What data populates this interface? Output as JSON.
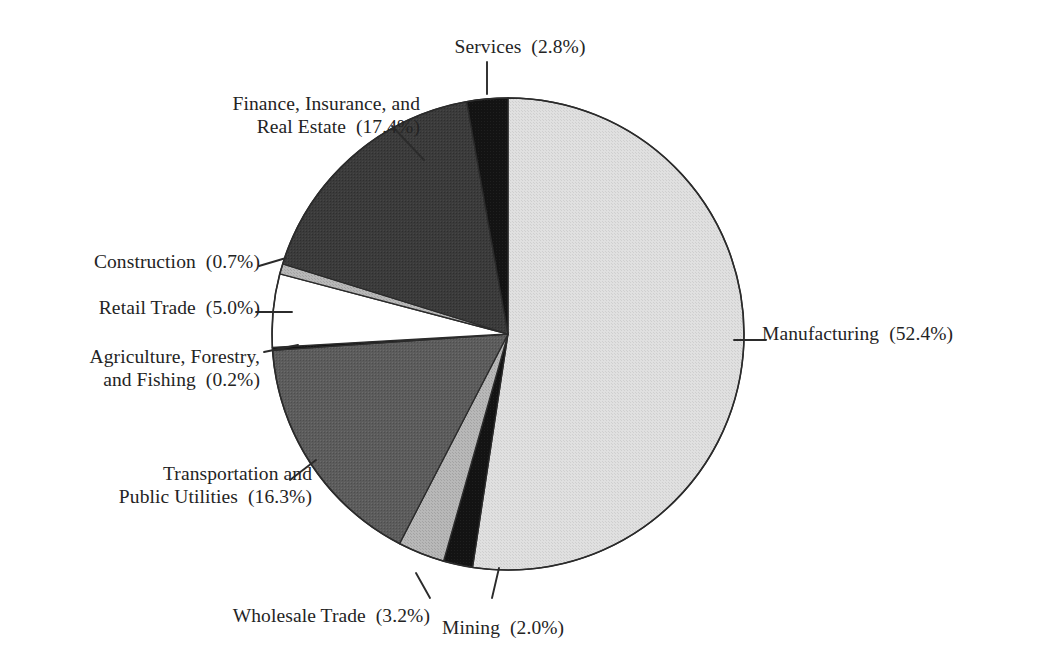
{
  "chart_data": {
    "type": "pie",
    "title": "",
    "subtitle": "",
    "xlabel": "",
    "ylabel": "",
    "legend_position": "none",
    "grid": false,
    "value_unit": "percent",
    "start_angle_deg": 0,
    "direction": "clockwise",
    "categories": [
      "Manufacturing",
      "Mining",
      "Wholesale Trade",
      "Transportation and Public Utilities",
      "Agriculture, Forestry, and Fishing",
      "Retail Trade",
      "Construction",
      "Finance, Insurance, and Real Estate",
      "Services"
    ],
    "values": [
      52.4,
      2.0,
      3.2,
      16.3,
      0.2,
      5.0,
      0.7,
      17.4,
      2.8
    ],
    "slices": [
      {
        "label": "Manufacturing",
        "value": 52.4,
        "color": "#dcdcdc"
      },
      {
        "label": "Mining",
        "value": 2.0,
        "color": "#161616"
      },
      {
        "label": "Wholesale Trade",
        "value": 3.2,
        "color": "#b3b3b3"
      },
      {
        "label": "Transportation and Public Utilities",
        "value": 16.3,
        "color": "#585858"
      },
      {
        "label": "Agriculture, Forestry, and Fishing",
        "value": 0.2,
        "color": "#161616"
      },
      {
        "label": "Retail Trade",
        "value": 5.0,
        "color": "#ffffff"
      },
      {
        "label": "Construction",
        "value": 0.7,
        "color": "#b3b3b3"
      },
      {
        "label": "Finance, Insurance, and Real Estate",
        "value": 17.4,
        "color": "#3a3a3a"
      },
      {
        "label": "Services",
        "value": 2.8,
        "color": "#161616"
      }
    ]
  },
  "labels": {
    "services": "Services  (2.8%)",
    "finance_line1": "Finance, Insurance, and",
    "finance_line2": "Real Estate  (17.4%)",
    "construction": "Construction  (0.7%)",
    "retail_trade": "Retail Trade  (5.0%)",
    "agriculture_line1": "Agriculture, Forestry,",
    "agriculture_line2": "and Fishing  (0.2%)",
    "transportation_line1": "Transportation and",
    "transportation_line2": "Public Utilities  (16.3%)",
    "wholesale_trade": "Wholesale Trade  (3.2%)",
    "mining": "Mining  (2.0%)",
    "manufacturing": "Manufacturing  (52.4%)"
  },
  "style": {
    "background": "#ffffff",
    "outline": "#2b2b2b",
    "text": "#242424",
    "leader_line": "#2b2b2b"
  }
}
